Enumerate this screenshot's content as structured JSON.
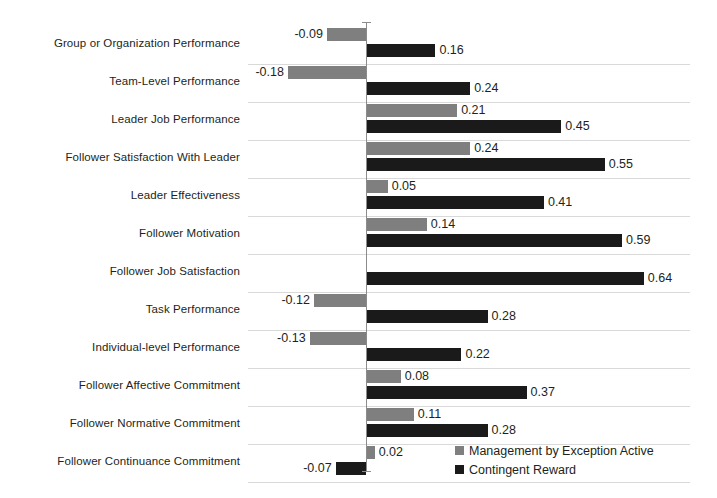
{
  "chart_data": {
    "type": "bar",
    "orientation": "horizontal",
    "title": "",
    "subtitle": "",
    "xlabel": "",
    "ylabel": "",
    "grid": true,
    "legend_position": "bottom-right",
    "xlim": [
      -0.2,
      0.7
    ],
    "zero_axis": 0,
    "categories": [
      "Group or Organization Performance",
      "Team-Level Performance",
      "Leader Job Performance",
      "Follower Satisfaction With Leader",
      "Leader Effectiveness",
      "Follower Motivation",
      "Follower Job Satisfaction",
      "Task Performance",
      "Individual-level Performance",
      "Follower Affective Commitment",
      "Follower Normative Commitment",
      "Follower Continuance Commitment"
    ],
    "series": [
      {
        "name": "Management by Exception Active",
        "color": "#7f7f7f",
        "values": [
          -0.09,
          -0.18,
          0.21,
          0.24,
          0.05,
          0.14,
          null,
          -0.12,
          -0.13,
          0.08,
          0.11,
          0.02
        ],
        "labels": [
          "-0.09",
          "-0.18",
          "0.21",
          "0.24",
          "0.05",
          "0.14",
          "",
          "-0.12",
          "-0.13",
          "0.08",
          "0.11",
          "0.02"
        ]
      },
      {
        "name": "Contingent Reward",
        "color": "#1a1a1a",
        "values": [
          0.16,
          0.24,
          0.45,
          0.55,
          0.41,
          0.59,
          0.64,
          0.28,
          0.22,
          0.37,
          0.28,
          -0.07
        ],
        "labels": [
          "0.16",
          "0.24",
          "0.45",
          "0.55",
          "0.41",
          "0.59",
          "0.64",
          "0.28",
          "0.22",
          "0.37",
          "0.28",
          "-0.07"
        ]
      }
    ]
  },
  "legend": {
    "items": [
      {
        "label": "Management by Exception Active",
        "color": "#7f7f7f"
      },
      {
        "label": "Contingent Reward",
        "color": "#1a1a1a"
      }
    ]
  }
}
